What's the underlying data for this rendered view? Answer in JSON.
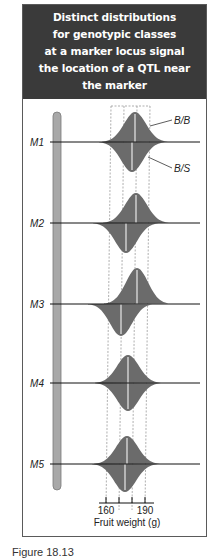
{
  "header": {
    "title_lines": [
      "Distinct distributions",
      "for genotypic classes",
      "at a marker locus signal",
      "the location of a QTL near",
      "the marker"
    ],
    "background": "#3a3a3a",
    "text_color": "#ffffff"
  },
  "colors": {
    "distribution_fill": "#6b6b6b",
    "chromosome_fill": "#a8a8a8",
    "chromosome_stroke": "#7a7a7a",
    "median_line": "#e8e8e8",
    "axis_line": "#111111",
    "dashed_guide": "#9a9a9a"
  },
  "legend": {
    "upper_label": "B/B",
    "lower_label": "B/S"
  },
  "markers": [
    {
      "label": "M1",
      "y": 142,
      "upper_median": 135,
      "lower_median": 132,
      "upper_height": 30,
      "lower_height": 30
    },
    {
      "label": "M2",
      "y": 223,
      "upper_median": 136,
      "lower_median": 126,
      "upper_height": 30,
      "lower_height": 30
    },
    {
      "label": "M3",
      "y": 304,
      "upper_median": 137,
      "lower_median": 121,
      "upper_height": 36,
      "lower_height": 32
    },
    {
      "label": "M4",
      "y": 383,
      "upper_median": 128,
      "lower_median": 128,
      "upper_height": 28,
      "lower_height": 28
    },
    {
      "label": "M5",
      "y": 464,
      "upper_median": 127,
      "lower_median": 125,
      "upper_height": 28,
      "lower_height": 28
    }
  ],
  "axis": {
    "label": "Fruit weight (g)",
    "tick_labels": [
      "160",
      "190"
    ],
    "ticks": [
      {
        "value": 160,
        "x": 106
      },
      {
        "value": 170,
        "x": 119
      },
      {
        "value": 180,
        "x": 132
      },
      {
        "value": 190,
        "x": 145
      }
    ]
  },
  "caption": "Figure 18.13",
  "chart_data": {
    "type": "area",
    "title": "Distinct distributions for genotypic classes at a marker locus signal the location of a QTL near the marker",
    "xlabel": "Fruit weight (g)",
    "ylabel": "",
    "x_ticks": [
      160,
      170,
      180,
      190
    ],
    "x_tick_labels_shown": [
      "160",
      "190"
    ],
    "series": [
      {
        "name": "M1 B/B",
        "median_g": 182
      },
      {
        "name": "M1 B/S",
        "median_g": 180
      },
      {
        "name": "M2 B/B",
        "median_g": 183
      },
      {
        "name": "M2 B/S",
        "median_g": 175
      },
      {
        "name": "M3 B/B",
        "median_g": 184
      },
      {
        "name": "M3 B/S",
        "median_g": 171
      },
      {
        "name": "M4 B/B",
        "median_g": 177
      },
      {
        "name": "M4 B/S",
        "median_g": 177
      },
      {
        "name": "M5 B/B",
        "median_g": 176
      },
      {
        "name": "M5 B/S",
        "median_g": 175
      }
    ],
    "legend": [
      "B/B",
      "B/S"
    ]
  }
}
